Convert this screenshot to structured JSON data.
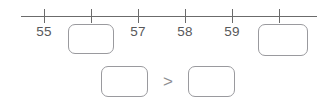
{
  "worksheet": {
    "title": "Number line comparison worksheet",
    "stroke_color": "#6b6b6b",
    "box_border_color": "#9a9a9e",
    "text_color": "#58585a",
    "background_color": "#ffffff"
  },
  "number_line": {
    "start_x": 21,
    "end_x": 317,
    "tick_spacing": 47,
    "tick_count": 6,
    "ticks": [
      {
        "x": 44,
        "label": "55",
        "label_shown": true,
        "has_answer_box": false
      },
      {
        "x": 91,
        "label": "56",
        "label_shown": false,
        "has_answer_box": true
      },
      {
        "x": 138,
        "label": "57",
        "label_shown": true,
        "has_answer_box": false
      },
      {
        "x": 185,
        "label": "58",
        "label_shown": true,
        "has_answer_box": false
      },
      {
        "x": 232,
        "label": "59",
        "label_shown": true,
        "has_answer_box": false
      },
      {
        "x": 279,
        "label": "60",
        "label_shown": false,
        "has_answer_box": true
      }
    ],
    "visible_labels": [
      "55",
      "57",
      "58",
      "59"
    ],
    "answer_boxes": [
      {
        "id": "numberline-box-1",
        "value": "",
        "placeholder": ""
      },
      {
        "id": "numberline-box-2",
        "value": "",
        "placeholder": ""
      }
    ]
  },
  "comparison": {
    "left_box": {
      "value": "",
      "placeholder": ""
    },
    "operator": ">",
    "right_box": {
      "value": "",
      "placeholder": ""
    }
  }
}
